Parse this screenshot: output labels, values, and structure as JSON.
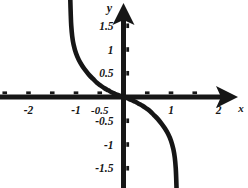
{
  "chart_data": {
    "type": "line",
    "title": "",
    "subtitle": "",
    "xlabel": "x",
    "ylabel": "y",
    "xlim": [
      -2.6,
      2.65
    ],
    "ylim": [
      -2.0,
      2.0
    ],
    "grid": false,
    "legend": null,
    "x_ticks": [
      -2.5,
      -2,
      -1.5,
      -1,
      -0.5,
      0.5,
      1,
      1.5,
      2,
      2.5
    ],
    "x_tick_labels": [
      {
        "value": -2,
        "label": "-2"
      },
      {
        "value": -1,
        "label": "-1"
      },
      {
        "value": -0.5,
        "label": "-0.5"
      },
      {
        "value": 1,
        "label": "1"
      },
      {
        "value": 2,
        "label": "2"
      }
    ],
    "y_ticks": [
      -1.5,
      -1,
      -0.5,
      0.5,
      1,
      1.5
    ],
    "y_tick_labels": [
      {
        "value": 1.5,
        "label": "1.5"
      },
      {
        "value": 1,
        "label": "1"
      },
      {
        "value": 0.5,
        "label": "0.5"
      },
      {
        "value": -0.5,
        "label": "-0.5"
      },
      {
        "value": -1,
        "label": "-1"
      },
      {
        "value": -1.5,
        "label": "-1.5"
      }
    ],
    "axis_arrows": {
      "x": "right",
      "y": "up"
    },
    "curve_color": "#161616",
    "axis_color": "#161616",
    "background_color": "#ffffff",
    "series": [
      {
        "name": "curve-upper-left-branch",
        "description": "decreasing branch approaching vertical asymptote near x = -1.1 from the right and falling toward the x-axis as x approaches 0",
        "points": [
          {
            "x": -1.12,
            "y": 2.05
          },
          {
            "x": -1.11,
            "y": 1.72
          },
          {
            "x": -1.1,
            "y": 1.5
          },
          {
            "x": -1.08,
            "y": 1.28
          },
          {
            "x": -1.05,
            "y": 1.1
          },
          {
            "x": -1.0,
            "y": 0.92
          },
          {
            "x": -0.94,
            "y": 0.78
          },
          {
            "x": -0.87,
            "y": 0.66
          },
          {
            "x": -0.8,
            "y": 0.56
          },
          {
            "x": -0.72,
            "y": 0.46
          },
          {
            "x": -0.64,
            "y": 0.38
          },
          {
            "x": -0.56,
            "y": 0.3
          },
          {
            "x": -0.48,
            "y": 0.24
          },
          {
            "x": -0.4,
            "y": 0.185
          },
          {
            "x": -0.32,
            "y": 0.14
          },
          {
            "x": -0.25,
            "y": 0.1
          },
          {
            "x": -0.18,
            "y": 0.068
          },
          {
            "x": -0.12,
            "y": 0.042
          },
          {
            "x": -0.06,
            "y": 0.02
          },
          {
            "x": 0,
            "y": 0
          }
        ]
      },
      {
        "name": "curve-lower-right-branch",
        "description": "point-symmetric continuation through the origin, decreasing and steepening toward a vertical asymptote near x = 1.1",
        "points": [
          {
            "x": 0,
            "y": 0
          },
          {
            "x": 0.06,
            "y": -0.02
          },
          {
            "x": 0.12,
            "y": -0.042
          },
          {
            "x": 0.18,
            "y": -0.068
          },
          {
            "x": 0.25,
            "y": -0.1
          },
          {
            "x": 0.32,
            "y": -0.14
          },
          {
            "x": 0.4,
            "y": -0.185
          },
          {
            "x": 0.48,
            "y": -0.24
          },
          {
            "x": 0.56,
            "y": -0.3
          },
          {
            "x": 0.64,
            "y": -0.38
          },
          {
            "x": 0.72,
            "y": -0.46
          },
          {
            "x": 0.8,
            "y": -0.56
          },
          {
            "x": 0.87,
            "y": -0.66
          },
          {
            "x": 0.94,
            "y": -0.78
          },
          {
            "x": 1.0,
            "y": -0.92
          },
          {
            "x": 1.05,
            "y": -1.1
          },
          {
            "x": 1.08,
            "y": -1.28
          },
          {
            "x": 1.1,
            "y": -1.5
          },
          {
            "x": 1.11,
            "y": -1.72
          },
          {
            "x": 1.12,
            "y": -2.05
          }
        ]
      }
    ]
  }
}
